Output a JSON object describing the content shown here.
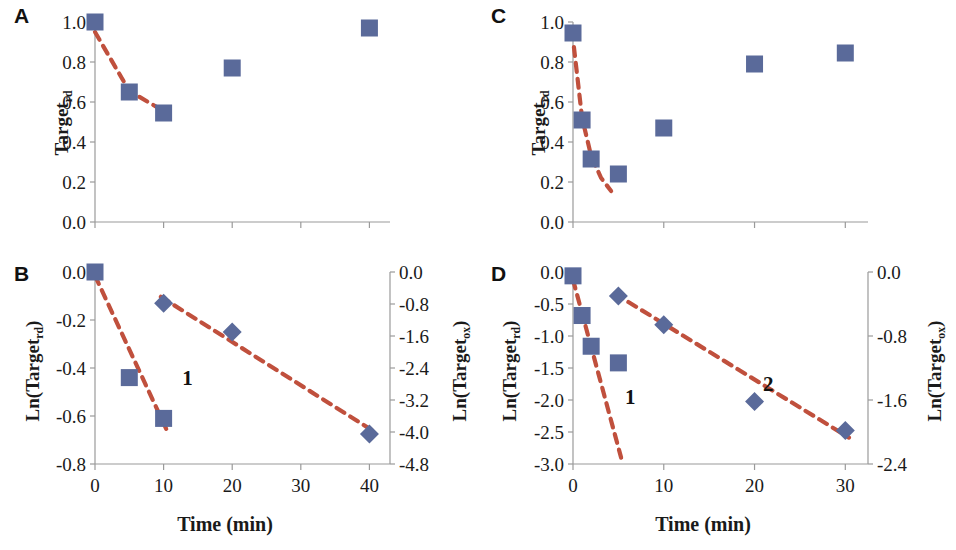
{
  "figure": {
    "width": 956,
    "height": 550,
    "marker_color": "#5a6a9a",
    "fit_line_color": "#c0503d",
    "axis_color": "#9a9a9a"
  },
  "panels": [
    {
      "letter": "A",
      "x_title": "",
      "y_left_title_main": "Target",
      "y_left_title_sub": "rd",
      "y_ticks": [
        "1.0",
        "0.8",
        "0.6",
        "0.4",
        "0.2",
        "0.0"
      ],
      "x_ticks": [
        "",
        "",
        "",
        "",
        ""
      ]
    },
    {
      "letter": "B",
      "x_title": "Time (min)",
      "y_left_title_main": "Ln(Target",
      "y_left_title_sub": "rd",
      "y_left_title_tail": ")",
      "y_right_title_main": "Ln(Target",
      "y_right_title_sub": "ox",
      "y_right_title_tail": ")",
      "y_ticks": [
        "0.0",
        "-0.2",
        "-0.4",
        "-0.6",
        "-0.8"
      ],
      "y_right_ticks": [
        "0.0",
        "-0.8",
        "-1.6",
        "-2.4",
        "-3.2",
        "-4.0",
        "-4.8"
      ],
      "x_ticks": [
        "0",
        "10",
        "20",
        "30",
        "40"
      ],
      "tags": [
        "1",
        "2"
      ]
    },
    {
      "letter": "C",
      "x_title": "",
      "y_left_title_main": "Target",
      "y_left_title_sub": "rd",
      "y_ticks": [
        "1.0",
        "0.8",
        "0.6",
        "0.4",
        "0.2",
        "0.0"
      ],
      "x_ticks": [
        "",
        "",
        "",
        ""
      ]
    },
    {
      "letter": "D",
      "x_title": "Time (min)",
      "y_left_title_main": "Ln(Target",
      "y_left_title_sub": "rd",
      "y_left_title_tail": ")",
      "y_right_title_main": "Ln(Target",
      "y_right_title_sub": "ox",
      "y_right_title_tail": ")",
      "y_ticks": [
        "0.0",
        "-0.5",
        "-1.0",
        "-1.5",
        "-2.0",
        "-2.5",
        "-3.0"
      ],
      "y_right_ticks": [
        "0.0",
        "-0.8",
        "-1.6",
        "-2.4"
      ],
      "x_ticks": [
        "0",
        "10",
        "20",
        "30"
      ],
      "tags": [
        "1",
        "2"
      ]
    }
  ],
  "chart_data": [
    {
      "type": "scatter",
      "panel": "A",
      "title": "",
      "xlabel": "",
      "ylabel": "Target_rd",
      "xlim": [
        0,
        43
      ],
      "ylim": [
        0.0,
        1.0
      ],
      "xticks": [
        0,
        10,
        20,
        30,
        40
      ],
      "yticks": [
        0.0,
        0.2,
        0.4,
        0.6,
        0.8,
        1.0
      ],
      "grid": false,
      "legend": "none",
      "series": [
        {
          "name": "Target_rd",
          "marker": "square",
          "color": "#5a6a9a",
          "x": [
            0,
            5,
            10,
            20,
            40
          ],
          "values": [
            1.0,
            0.65,
            0.545,
            0.77,
            0.97
          ]
        }
      ],
      "fit_curve": {
        "name": "exponential decay fit",
        "style": "dashed",
        "color": "#c0503d",
        "x": [
          0,
          5,
          10
        ],
        "values": [
          0.95,
          0.655,
          0.555
        ]
      }
    },
    {
      "type": "scatter",
      "panel": "B",
      "title": "",
      "xlabel": "Time (min)",
      "ylabel": "Ln(Target_rd)",
      "ylabel_right": "Ln(Target_ox)",
      "xlim": [
        0,
        43
      ],
      "ylim": [
        -0.8,
        0.0
      ],
      "ylim_right": [
        -4.8,
        0.0
      ],
      "xticks": [
        0,
        10,
        20,
        30,
        40
      ],
      "yticks": [
        0.0,
        -0.2,
        -0.4,
        -0.6,
        -0.8
      ],
      "yticks_right": [
        0.0,
        -0.8,
        -1.6,
        -2.4,
        -3.2,
        -4.0,
        -4.8
      ],
      "grid": false,
      "legend": "none",
      "series": [
        {
          "name": "Ln(Target_rd) phase 1",
          "marker": "square",
          "axis": "left",
          "color": "#5a6a9a",
          "x": [
            0,
            5,
            10
          ],
          "values": [
            0.0,
            -0.44,
            -0.61
          ]
        },
        {
          "name": "Ln(Target_ox) phase 2",
          "marker": "diamond",
          "axis": "right",
          "color": "#5a6a9a",
          "x": [
            10,
            20,
            40
          ],
          "values": [
            -0.78,
            -1.5,
            -4.05
          ]
        }
      ],
      "fit_lines": [
        {
          "name": "1",
          "style": "dashed",
          "color": "#c0503d",
          "axis": "left",
          "x": [
            0,
            10.4
          ],
          "values": [
            -0.015,
            -0.655
          ]
        },
        {
          "name": "2",
          "style": "dashed",
          "color": "#c0503d",
          "axis": "right",
          "x": [
            9.6,
            40.3
          ],
          "values": [
            -0.62,
            -3.95
          ]
        }
      ],
      "annotations": [
        {
          "text": "1",
          "x": 13.5,
          "y": -0.44
        },
        {
          "text": "2",
          "x": 30.5,
          "y": -2.45
        }
      ]
    },
    {
      "type": "scatter",
      "panel": "C",
      "title": "",
      "xlabel": "",
      "ylabel": "Target_rd",
      "xlim": [
        0,
        32.5
      ],
      "ylim": [
        0.0,
        1.0
      ],
      "xticks": [
        0,
        10,
        20,
        30
      ],
      "yticks": [
        0.0,
        0.2,
        0.4,
        0.6,
        0.8,
        1.0
      ],
      "grid": false,
      "legend": "none",
      "series": [
        {
          "name": "Target_rd",
          "marker": "square",
          "color": "#5a6a9a",
          "x": [
            0,
            1,
            2,
            5,
            10,
            20,
            30
          ],
          "values": [
            0.945,
            0.51,
            0.315,
            0.24,
            0.47,
            0.79,
            0.845
          ]
        }
      ],
      "fit_curve": {
        "name": "exponential decay fit",
        "style": "dashed",
        "color": "#c0503d",
        "x": [
          0.1,
          1,
          2,
          3.1,
          4.2
        ],
        "values": [
          0.875,
          0.52,
          0.33,
          0.22,
          0.155
        ]
      }
    },
    {
      "type": "scatter",
      "panel": "D",
      "title": "",
      "xlabel": "Time (min)",
      "ylabel": "Ln(Target_rd)",
      "ylabel_right": "Ln(Target_ox)",
      "xlim": [
        0,
        32.5
      ],
      "ylim": [
        -3.0,
        0.0
      ],
      "ylim_right": [
        -2.4,
        0.0
      ],
      "xticks": [
        0,
        10,
        20,
        30
      ],
      "yticks": [
        0.0,
        -0.5,
        -1.0,
        -1.5,
        -2.0,
        -2.5,
        -3.0
      ],
      "yticks_right": [
        0.0,
        -0.8,
        -1.6,
        -2.4
      ],
      "grid": false,
      "legend": "none",
      "series": [
        {
          "name": "Ln(Target_rd) phase 1",
          "marker": "square",
          "axis": "left",
          "color": "#5a6a9a",
          "x": [
            0,
            1,
            2,
            5
          ],
          "values": [
            -0.06,
            -0.68,
            -1.16,
            -1.42
          ]
        },
        {
          "name": "Ln(Target_ox) phase 2",
          "marker": "diamond",
          "axis": "right",
          "color": "#5a6a9a",
          "x": [
            5,
            10,
            20,
            30
          ],
          "values": [
            -0.3,
            -0.66,
            -1.62,
            -1.98
          ]
        }
      ],
      "fit_lines": [
        {
          "name": "1",
          "style": "dashed",
          "color": "#c0503d",
          "axis": "left",
          "x": [
            0,
            5.3
          ],
          "values": [
            -0.12,
            -2.9
          ]
        },
        {
          "name": "2",
          "style": "dashed",
          "color": "#c0503d",
          "axis": "right",
          "x": [
            4.6,
            30.4
          ],
          "values": [
            -0.27,
            -2.07
          ]
        }
      ],
      "annotations": [
        {
          "text": "1",
          "x": 6.3,
          "y": -1.95
        },
        {
          "text": "2",
          "x": 21.5,
          "y": -1.75
        }
      ]
    }
  ]
}
